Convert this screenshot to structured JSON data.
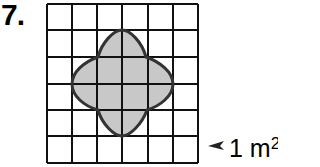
{
  "problem": {
    "number": "7."
  },
  "grid": {
    "columns": 6,
    "rows": 6,
    "line_color": "#111111"
  },
  "shape": {
    "description": "four-lobed curved figure (quatrefoil) on square grid",
    "fill_color": "#c8c8c8",
    "stroke_color": "#333333"
  },
  "legend": {
    "unit_value": "1 m",
    "unit_exponent": "2",
    "pointer_icon": "arrow-left-icon"
  }
}
